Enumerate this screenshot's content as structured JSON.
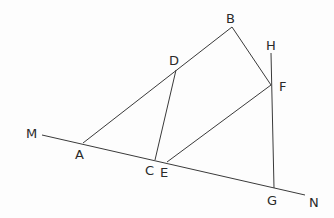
{
  "diagram": {
    "type": "geometry",
    "line_color": "#3a3a3a",
    "points": {
      "M": {
        "label": "M",
        "x": 42,
        "y": 135
      },
      "A": {
        "label": "A",
        "x": 83,
        "y": 143
      },
      "C": {
        "label": "C",
        "x": 155,
        "y": 160
      },
      "E": {
        "label": "E",
        "x": 167,
        "y": 162
      },
      "G": {
        "label": "G",
        "x": 274,
        "y": 188
      },
      "N": {
        "label": "N",
        "x": 305,
        "y": 195
      },
      "B": {
        "label": "B",
        "x": 232,
        "y": 27
      },
      "D": {
        "label": "D",
        "x": 176,
        "y": 70
      },
      "F": {
        "label": "F",
        "x": 271,
        "y": 85
      },
      "H": {
        "label": "H",
        "x": 271,
        "y": 53
      }
    },
    "segments": [
      [
        "M",
        "N"
      ],
      [
        "A",
        "B"
      ],
      [
        "B",
        "F"
      ],
      [
        "D",
        "C"
      ],
      [
        "E",
        "F"
      ],
      [
        "H",
        "G"
      ]
    ]
  }
}
